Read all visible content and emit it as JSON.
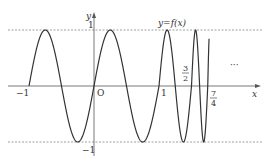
{
  "figure": {
    "curve_label": "y=f(x)",
    "axis_x_label": "x",
    "axis_y_label": "y",
    "origin_label": "O",
    "ellipsis": "···",
    "ticks": {
      "x_neg1": "−1",
      "x_1": "1",
      "y_1": "1",
      "y_neg1": "−1",
      "frac_3_2": {
        "num": "3",
        "den": "2"
      },
      "frac_7_4": {
        "num": "7",
        "den": "4"
      }
    }
  },
  "chart_data": {
    "type": "line",
    "title": "",
    "xlabel": "x",
    "ylabel": "y",
    "curve_label": "y=f(x)",
    "xlim": [
      -1.1,
      2.6
    ],
    "ylim": [
      -1,
      1
    ],
    "grid": false,
    "reference_lines": [
      {
        "y": 1,
        "style": "dashed"
      },
      {
        "y": -1,
        "style": "dashed"
      }
    ],
    "x_ticks": [
      {
        "value": -1,
        "label": "−1"
      },
      {
        "value": 0,
        "label": "O"
      },
      {
        "value": 1,
        "label": "1"
      },
      {
        "value": 1.5,
        "label": "3/2"
      },
      {
        "value": 1.75,
        "label": "7/4"
      }
    ],
    "y_ticks": [
      {
        "value": 1,
        "label": "1"
      },
      {
        "value": -1,
        "label": "−1"
      }
    ],
    "segments": [
      {
        "domain": [
          -1,
          1
        ],
        "formula": "sin(2πx)",
        "period": 1
      },
      {
        "domain": [
          1,
          1.5
        ],
        "formula": "sin(4π(x−1))",
        "period": 0.5
      },
      {
        "domain": [
          1.5,
          1.75
        ],
        "formula": "sin(8π(x−1.5))",
        "period": 0.25
      },
      {
        "domain": [
          1.75,
          1.77
        ],
        "formula": "sin(16π(x−1.75)) (partial)",
        "period": 0.125
      }
    ],
    "annotation": "··· (pattern continues)"
  }
}
